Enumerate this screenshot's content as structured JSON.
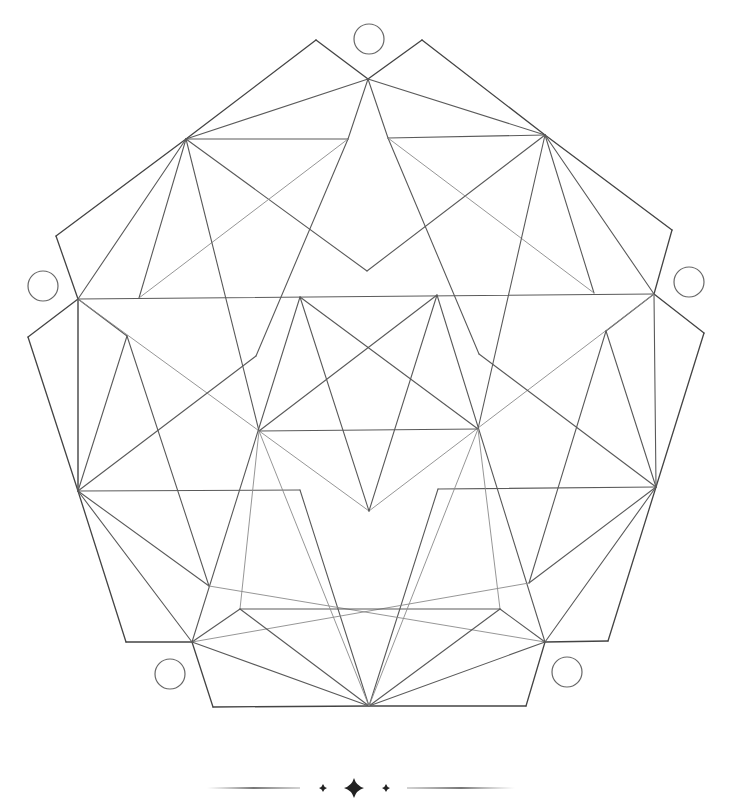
{
  "figure": {
    "stroke_color": "#5a5a5a",
    "background": "#ffffff",
    "points": {
      "TOP": [
        368,
        79
      ],
      "PL": [
        316,
        40
      ],
      "PR": [
        422,
        40
      ],
      "UL": [
        186,
        139
      ],
      "UR": [
        545,
        135
      ],
      "ULi": [
        348,
        139
      ],
      "URi": [
        388,
        138
      ],
      "VB": [
        367,
        271
      ],
      "OCL": [
        56,
        236
      ],
      "OCR": [
        672,
        230
      ],
      "ML": [
        78,
        299
      ],
      "MR": [
        654,
        294
      ],
      "MLi": [
        139,
        298
      ],
      "MRi": [
        594,
        293
      ],
      "OCL2": [
        28,
        337
      ],
      "OCR2": [
        704,
        333
      ],
      "LLk": [
        127,
        336
      ],
      "RLk": [
        606,
        331
      ],
      "LB": [
        256,
        356
      ],
      "RB": [
        479,
        354
      ],
      "S1": [
        300,
        297
      ],
      "S2": [
        437,
        295
      ],
      "S3": [
        259,
        431
      ],
      "S4": [
        478,
        429
      ],
      "S5": [
        369,
        511
      ],
      "LL": [
        78,
        491
      ],
      "RR": [
        656,
        487
      ],
      "BLs": [
        300,
        490
      ],
      "BRs": [
        438,
        489
      ],
      "LLp": [
        209,
        586
      ],
      "RRp": [
        529,
        583
      ],
      "BCL": [
        126,
        642
      ],
      "BCR": [
        608,
        641
      ],
      "BL": [
        192,
        642
      ],
      "BR": [
        545,
        642
      ],
      "BLi": [
        240,
        609
      ],
      "BRi": [
        500,
        609
      ],
      "BOT": [
        369,
        706
      ],
      "BFL": [
        213,
        707
      ],
      "BFR": [
        526,
        706
      ]
    },
    "lines": [
      [
        "PL",
        "TOP",
        "dk"
      ],
      [
        "PR",
        "TOP",
        "dk"
      ],
      [
        "PL",
        "UL",
        "dk"
      ],
      [
        "PR",
        "UR",
        "dk"
      ],
      [
        "UL",
        "OCL",
        "dk"
      ],
      [
        "OCL",
        "ML",
        "dk"
      ],
      [
        "UR",
        "OCR",
        "dk"
      ],
      [
        "OCR",
        "MR",
        "dk"
      ],
      [
        "ML",
        "OCL2",
        "dk"
      ],
      [
        "OCL2",
        "LL",
        "dk"
      ],
      [
        "MR",
        "OCR2",
        "dk"
      ],
      [
        "OCR2",
        "RR",
        "dk"
      ],
      [
        "LL",
        "BCL",
        "dk"
      ],
      [
        "BCL",
        "BL",
        "dk"
      ],
      [
        "RR",
        "BCR",
        "dk"
      ],
      [
        "BCR",
        "BR",
        "dk"
      ],
      [
        "BL",
        "BFL",
        "dk"
      ],
      [
        "BFL",
        "BOT",
        "dk"
      ],
      [
        "BR",
        "BFR",
        "dk"
      ],
      [
        "BFR",
        "BOT",
        "dk"
      ],
      [
        "TOP",
        "UL",
        ""
      ],
      [
        "TOP",
        "UR",
        ""
      ],
      [
        "TOP",
        "ULi",
        ""
      ],
      [
        "TOP",
        "URi",
        ""
      ],
      [
        "UL",
        "ULi",
        ""
      ],
      [
        "UR",
        "URi",
        ""
      ],
      [
        "ULi",
        "LB",
        ""
      ],
      [
        "URi",
        "RB",
        ""
      ],
      [
        "UL",
        "VB",
        ""
      ],
      [
        "UR",
        "VB",
        ""
      ],
      [
        "UL",
        "MLi",
        ""
      ],
      [
        "UR",
        "MRi",
        ""
      ],
      [
        "UL",
        "ML",
        ""
      ],
      [
        "UR",
        "MR",
        ""
      ],
      [
        "ULi",
        "MLi",
        "lt"
      ],
      [
        "URi",
        "MRi",
        "lt"
      ],
      [
        "UL",
        "S3",
        ""
      ],
      [
        "UR",
        "S4",
        ""
      ],
      [
        "ML",
        "MR",
        ""
      ],
      [
        "ML",
        "LL",
        ""
      ],
      [
        "MR",
        "RR",
        ""
      ],
      [
        "ML",
        "LLk",
        ""
      ],
      [
        "MR",
        "RLk",
        ""
      ],
      [
        "ML",
        "S5",
        "lt"
      ],
      [
        "MR",
        "S5",
        "lt"
      ],
      [
        "LLk",
        "LL",
        ""
      ],
      [
        "RLk",
        "RR",
        ""
      ],
      [
        "LLk",
        "LLp",
        ""
      ],
      [
        "RLk",
        "RRp",
        ""
      ],
      [
        "LL",
        "LB",
        ""
      ],
      [
        "RR",
        "RB",
        ""
      ],
      [
        "ML",
        "LL",
        ""
      ],
      [
        "S1",
        "S4",
        ""
      ],
      [
        "S1",
        "S5",
        ""
      ],
      [
        "S2",
        "S3",
        ""
      ],
      [
        "S2",
        "S5",
        ""
      ],
      [
        "S3",
        "S4",
        ""
      ],
      [
        "S1",
        "BL",
        ""
      ],
      [
        "S2",
        "BR",
        ""
      ],
      [
        "LL",
        "BLs",
        ""
      ],
      [
        "RR",
        "BRs",
        ""
      ],
      [
        "BLs",
        "BOT",
        ""
      ],
      [
        "BRs",
        "BOT",
        ""
      ],
      [
        "LL",
        "LLp",
        ""
      ],
      [
        "RR",
        "RRp",
        ""
      ],
      [
        "LL",
        "BL",
        ""
      ],
      [
        "RR",
        "BR",
        ""
      ],
      [
        "LLp",
        "BR",
        "lt"
      ],
      [
        "RRp",
        "BL",
        "lt"
      ],
      [
        "S3",
        "BLi",
        "lt"
      ],
      [
        "S4",
        "BRi",
        "lt"
      ],
      [
        "BL",
        "BLi",
        ""
      ],
      [
        "BR",
        "BRi",
        ""
      ],
      [
        "BLi",
        "BRi",
        ""
      ],
      [
        "BLi",
        "BOT",
        ""
      ],
      [
        "BRi",
        "BOT",
        ""
      ],
      [
        "BL",
        "BOT",
        ""
      ],
      [
        "BR",
        "BOT",
        ""
      ],
      [
        "S3",
        "BOT",
        "lt"
      ],
      [
        "S4",
        "BOT",
        "lt"
      ]
    ],
    "circles": [
      {
        "name": "top-circle",
        "cx": 369,
        "cy": 39,
        "r": 15
      },
      {
        "name": "left-circle",
        "cx": 43,
        "cy": 286,
        "r": 15
      },
      {
        "name": "right-circle",
        "cx": 689,
        "cy": 282,
        "r": 15
      },
      {
        "name": "bottom-left-circle",
        "cx": 170,
        "cy": 674,
        "r": 15
      },
      {
        "name": "bottom-right-circle",
        "cx": 567,
        "cy": 672,
        "r": 15
      }
    ]
  },
  "divider": {
    "y": 788,
    "left_line": [
      207,
      300
    ],
    "right_line": [
      407,
      515
    ],
    "stars": [
      {
        "name": "small-star-left",
        "x": 323,
        "size": 4
      },
      {
        "name": "large-star",
        "x": 354,
        "size": 10
      },
      {
        "name": "small-star-right",
        "x": 386,
        "size": 4
      }
    ]
  }
}
